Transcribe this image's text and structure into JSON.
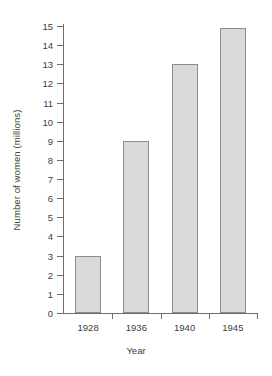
{
  "chart_data": {
    "type": "bar",
    "title": "",
    "categories": [
      "1928",
      "1936",
      "1940",
      "1945"
    ],
    "values": [
      3,
      9,
      13,
      14.9
    ],
    "series": [
      {
        "name": "Number of women",
        "values": [
          3,
          9,
          13,
          14.9
        ]
      }
    ],
    "xlabel": "Year",
    "ylabel": "Number of women (millions)",
    "ylim": [
      0,
      15
    ],
    "ytick_step": 1,
    "yticks": [
      "15",
      "14",
      "13",
      "12",
      "11",
      "10",
      "9",
      "8",
      "7",
      "6",
      "5",
      "4",
      "3",
      "2",
      "1",
      "0"
    ],
    "grid": false,
    "legend": false,
    "legend_position": "none",
    "bar_fill_color": "#d9d9d9",
    "bar_border_color": "#8c8c8c",
    "axis_color": "#6e6e6e",
    "background_color": "#ffffff"
  }
}
